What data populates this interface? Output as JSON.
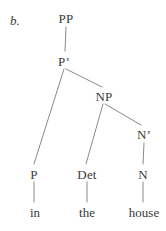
{
  "figure": {
    "example_label": "b.",
    "caption": "",
    "line_color": "#8a8a8a",
    "text_color": "#3a3a3a",
    "background": "#ffffff"
  },
  "tree": {
    "nodes": [
      {
        "id": "PP",
        "label": "PP",
        "x": 66,
        "y": 12
      },
      {
        "id": "Pbar",
        "label": "P’",
        "x": 64,
        "y": 55
      },
      {
        "id": "NP",
        "label": "NP",
        "x": 104,
        "y": 90
      },
      {
        "id": "Nbar",
        "label": "N’",
        "x": 144,
        "y": 128
      },
      {
        "id": "P",
        "label": "P",
        "x": 34,
        "y": 168
      },
      {
        "id": "Det",
        "label": "Det",
        "x": 87,
        "y": 168
      },
      {
        "id": "N",
        "label": "N",
        "x": 143,
        "y": 168
      }
    ],
    "leaves": [
      {
        "id": "in",
        "label": "in",
        "x": 35,
        "y": 206
      },
      {
        "id": "the",
        "label": "the",
        "x": 87,
        "y": 206
      },
      {
        "id": "house",
        "label": "house",
        "x": 144,
        "y": 206
      }
    ],
    "edges": [
      {
        "from": "PP",
        "to": "Pbar",
        "x1": 66,
        "y1": 27,
        "x2": 65,
        "y2": 51
      },
      {
        "from": "Pbar",
        "to": "P",
        "x1": 64,
        "y1": 69,
        "x2": 34,
        "y2": 164
      },
      {
        "from": "Pbar",
        "to": "NP",
        "x1": 66,
        "y1": 69,
        "x2": 102,
        "y2": 87
      },
      {
        "from": "NP",
        "to": "Det",
        "x1": 103,
        "y1": 104,
        "x2": 86,
        "y2": 164
      },
      {
        "from": "NP",
        "to": "Nbar",
        "x1": 105,
        "y1": 104,
        "x2": 141,
        "y2": 125
      },
      {
        "from": "Nbar",
        "to": "N",
        "x1": 144,
        "y1": 143,
        "x2": 143,
        "y2": 164
      },
      {
        "from": "P",
        "to": "in",
        "x1": 34,
        "y1": 182,
        "x2": 34,
        "y2": 202
      },
      {
        "from": "Det",
        "to": "the",
        "x1": 87,
        "y1": 182,
        "x2": 87,
        "y2": 202
      },
      {
        "from": "N",
        "to": "house",
        "x1": 143,
        "y1": 182,
        "x2": 143,
        "y2": 202
      }
    ]
  }
}
